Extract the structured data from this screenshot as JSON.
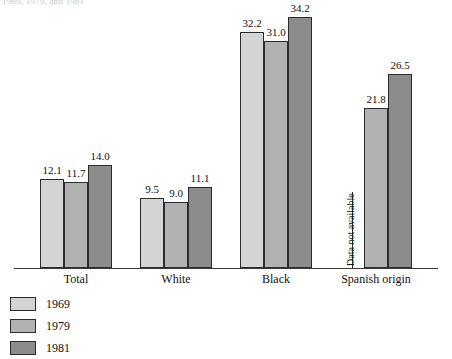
{
  "caption_remnant": "1969, 1979, and 1981",
  "chart_data": {
    "type": "bar",
    "title": "",
    "subtitle": "",
    "xlabel": "",
    "ylabel": "",
    "ylim": [
      0,
      36
    ],
    "grid": false,
    "legend_position": "bottom-left",
    "categories": [
      "Total",
      "White",
      "Black",
      "Spanish origin"
    ],
    "series": [
      {
        "name": "1969",
        "color": "#d4d4d4",
        "values": [
          12.1,
          9.5,
          32.2,
          null
        ],
        "labels": [
          "12.1",
          "9.5",
          "32.2",
          "Data not available"
        ]
      },
      {
        "name": "1979",
        "color": "#b2b2b2",
        "values": [
          11.7,
          9.0,
          31.0,
          21.8
        ],
        "labels": [
          "11.7",
          "9.0",
          "31.0",
          "21.8"
        ]
      },
      {
        "name": "1981",
        "color": "#8c8c8c",
        "values": [
          14.0,
          11.1,
          34.2,
          26.5
        ],
        "labels": [
          "14.0",
          "11.1",
          "34.2",
          "26.5"
        ]
      }
    ],
    "annotations": [
      {
        "text": "Data not available",
        "category": "Spanish origin",
        "series": "1969",
        "orientation": "vertical"
      }
    ]
  },
  "legend": {
    "items": [
      {
        "label": "1969",
        "color": "#d4d4d4"
      },
      {
        "label": "1979",
        "color": "#b2b2b2"
      },
      {
        "label": "1981",
        "color": "#8c8c8c"
      }
    ]
  },
  "axis": {
    "categories": [
      "Total",
      "White",
      "Black",
      "Spanish origin"
    ]
  }
}
